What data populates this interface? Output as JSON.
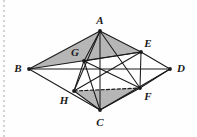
{
  "figure": {
    "canvas": {
      "width": 197,
      "height": 137
    },
    "background_color": "#fefefe",
    "stroke_color": "#1a1a1a",
    "fill_color": "#a9a9a9",
    "fill_opacity": 0.85,
    "margin_guide": "dotted-left-margin",
    "vertices": [
      {
        "id": "A",
        "label": "A",
        "x": 100,
        "y": 31,
        "label_x": 100,
        "label_y": 20
      },
      {
        "id": "B",
        "label": "B",
        "x": 29,
        "y": 69,
        "label_x": 18,
        "label_y": 68
      },
      {
        "id": "C",
        "label": "C",
        "x": 100,
        "y": 110,
        "label_x": 100,
        "label_y": 122
      },
      {
        "id": "D",
        "label": "D",
        "x": 170,
        "y": 69,
        "label_x": 181,
        "label_y": 68
      },
      {
        "id": "E",
        "label": "E",
        "x": 141,
        "y": 52,
        "label_x": 148,
        "label_y": 43
      },
      {
        "id": "F",
        "label": "F",
        "x": 140,
        "y": 88,
        "label_x": 148,
        "label_y": 96
      },
      {
        "id": "G",
        "label": "G",
        "x": 84,
        "y": 61,
        "label_x": 75,
        "label_y": 52
      },
      {
        "id": "H",
        "label": "H",
        "x": 74,
        "y": 91,
        "label_x": 64,
        "label_y": 100
      }
    ],
    "solid_edges": [
      {
        "from": "A",
        "to": "B"
      },
      {
        "from": "A",
        "to": "C"
      },
      {
        "from": "A",
        "to": "E"
      },
      {
        "from": "A",
        "to": "F"
      },
      {
        "from": "A",
        "to": "G"
      },
      {
        "from": "A",
        "to": "H"
      },
      {
        "from": "B",
        "to": "C"
      },
      {
        "from": "B",
        "to": "D"
      },
      {
        "from": "B",
        "to": "E"
      },
      {
        "from": "C",
        "to": "D"
      },
      {
        "from": "C",
        "to": "F"
      },
      {
        "from": "C",
        "to": "G"
      },
      {
        "from": "D",
        "to": "E"
      },
      {
        "from": "D",
        "to": "F"
      },
      {
        "from": "E",
        "to": "F"
      },
      {
        "from": "E",
        "to": "G"
      },
      {
        "from": "G",
        "to": "F"
      },
      {
        "from": "H",
        "to": "E"
      },
      {
        "from": "H",
        "to": "C"
      },
      {
        "from": "G",
        "to": "H"
      }
    ],
    "dashed_edges": [
      {
        "from": "H",
        "to": "F"
      }
    ],
    "shaded_faces": [
      {
        "id": "face-BAE",
        "vertices": [
          "B",
          "A",
          "E"
        ]
      },
      {
        "id": "face-HFC",
        "vertices": [
          "H",
          "F",
          "C"
        ]
      }
    ]
  }
}
